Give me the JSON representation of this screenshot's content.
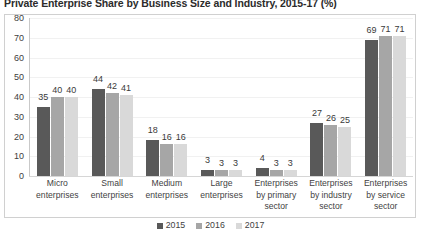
{
  "chart_data": {
    "type": "bar",
    "title": "Private Enterprise Share by Business Size and Industry, 2015-17 (%)",
    "xlabel": "",
    "ylabel": "",
    "ylim": [
      0,
      80
    ],
    "ytick_step": 10,
    "yticks": [
      "80",
      "70",
      "60",
      "50",
      "40",
      "30",
      "20",
      "10",
      "0"
    ],
    "grid": true,
    "legend_position": "bottom",
    "categories": [
      "Micro enterprises",
      "Small enterprises",
      "Medium enterprises",
      "Large enterprises",
      "Enterprises by primary sector",
      "Enterprises by industry sector",
      "Enterprises by service sector"
    ],
    "series": [
      {
        "name": "2015",
        "color": "#595959",
        "values": [
          35,
          44,
          18,
          3,
          4,
          27,
          69
        ]
      },
      {
        "name": "2016",
        "color": "#a6a6a6",
        "values": [
          40,
          42,
          16,
          3,
          3,
          26,
          71
        ]
      },
      {
        "name": "2017",
        "color": "#d9d9d9",
        "values": [
          40,
          41,
          16,
          3,
          3,
          25,
          71
        ]
      }
    ]
  }
}
